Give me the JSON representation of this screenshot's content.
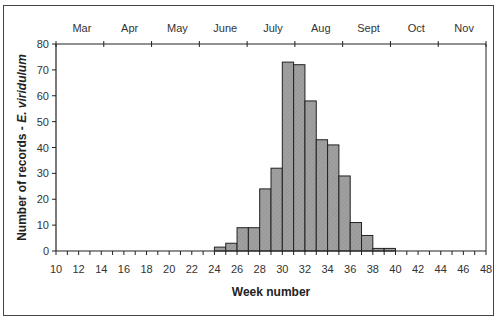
{
  "chart_data": {
    "type": "bar",
    "title": "",
    "xlabel": "Week number",
    "ylabel": "Number of records - E. viridulum",
    "ylabel_plain": "Number of records  - ",
    "ylabel_species": "E. viridulum",
    "ylim": [
      0,
      80
    ],
    "yticks": [
      0,
      10,
      20,
      30,
      40,
      50,
      60,
      70,
      80
    ],
    "xlim": [
      10,
      48
    ],
    "xtick_labels": [
      "10",
      "12",
      "14",
      "16",
      "18",
      "20",
      "22",
      "24",
      "26",
      "28",
      "30",
      "32",
      "34",
      "36",
      "38",
      "40",
      "42",
      "44",
      "46",
      "48"
    ],
    "top_axis_months": [
      "Mar",
      "Apr",
      "May",
      "June",
      "July",
      "Aug",
      "Sept",
      "Oct",
      "Nov"
    ],
    "grid": false,
    "legend": null,
    "bar_color": "#a0a0a0",
    "categories": [
      10,
      11,
      12,
      13,
      14,
      15,
      16,
      17,
      18,
      19,
      20,
      21,
      22,
      23,
      24,
      25,
      26,
      27,
      28,
      29,
      30,
      31,
      32,
      33,
      34,
      35,
      36,
      37,
      38,
      39,
      40,
      41,
      42,
      43,
      44,
      45,
      46,
      47
    ],
    "values": [
      0,
      0,
      0,
      0,
      0,
      0,
      0,
      0,
      0,
      0,
      0,
      0,
      0,
      0,
      1.5,
      3,
      9,
      9,
      24,
      32,
      73,
      72,
      58,
      43,
      41,
      29,
      11,
      6,
      1,
      1,
      0,
      0,
      0,
      0,
      0,
      0,
      0,
      0
    ]
  }
}
